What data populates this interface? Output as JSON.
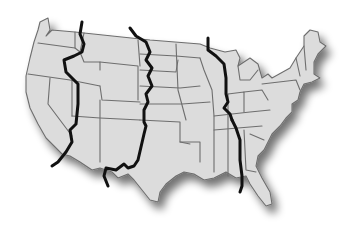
{
  "map": {
    "subject": "Contiguous United States",
    "style": "grayscale state outline map with drop shadow",
    "colors": {
      "land": "#dcdcdc",
      "state_border": "#6e6e6e",
      "time_zone_line": "#111111",
      "background": "#ffffff",
      "shadow": "#8a8a8a"
    },
    "overlays": [
      {
        "name": "Pacific/Mountain time zone boundary"
      },
      {
        "name": "Mountain/Central time zone boundary"
      },
      {
        "name": "Central/Eastern time zone boundary (north, Michigan)"
      },
      {
        "name": "Central/Eastern time zone boundary (south)"
      }
    ],
    "regions": [
      "Pacific",
      "Mountain",
      "Central",
      "Eastern"
    ]
  }
}
